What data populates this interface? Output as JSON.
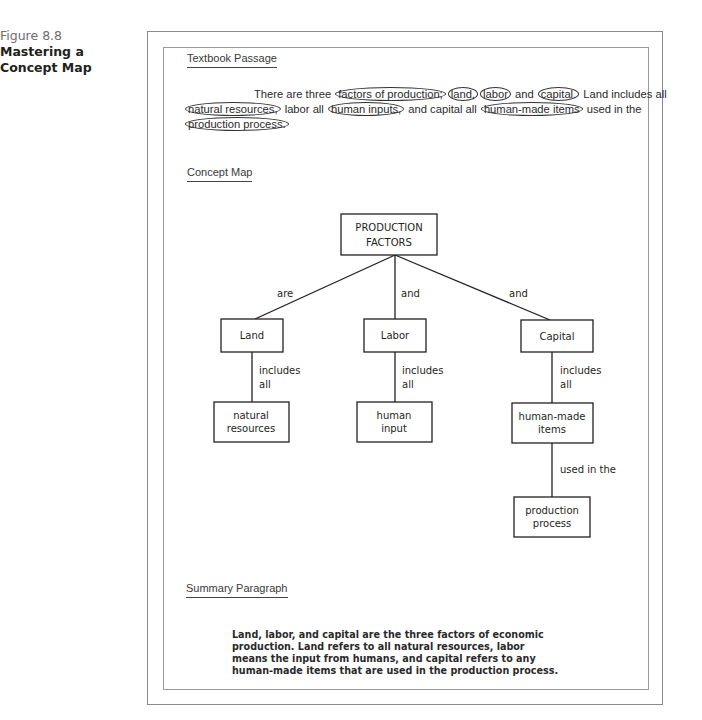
{
  "figure": {
    "number": "Figure 8.8",
    "title": "Mastering a Concept Map"
  },
  "textbook_passage": {
    "heading": "Textbook Passage",
    "lines": [
      [
        {
          "text": "There are three ",
          "circled": false
        },
        {
          "text": "factors of production;",
          "circled": true
        },
        {
          "text": "land,",
          "circled": true
        },
        {
          "text": "labor",
          "circled": true
        },
        {
          "text": " and ",
          "circled": false
        },
        {
          "text": "capital.",
          "circled": true
        },
        {
          "text": " Land includes all",
          "circled": false
        }
      ],
      [
        {
          "text": "natural resources,",
          "circled": true
        },
        {
          "text": " labor all ",
          "circled": false
        },
        {
          "text": "human inputs,",
          "circled": true
        },
        {
          "text": " and capital all ",
          "circled": false
        },
        {
          "text": "human-made items",
          "circled": true
        },
        {
          "text": " used in the",
          "circled": false
        }
      ],
      [
        {
          "text": "production process.",
          "circled": true
        }
      ]
    ]
  },
  "concept_map": {
    "heading": "Concept Map",
    "root": {
      "line1": "PRODUCTION",
      "line2": "FACTORS"
    },
    "links": {
      "land": "are",
      "labor": "and",
      "capital": "and"
    },
    "nodes": {
      "land": "Land",
      "labor": "Labor",
      "capital": "Capital",
      "natural_resources": {
        "line1": "natural",
        "line2": "resources"
      },
      "human_input": {
        "line1": "human",
        "line2": "input"
      },
      "human_made_items": {
        "line1": "human-made",
        "line2": "items"
      },
      "production_process": {
        "line1": "production",
        "line2": "process"
      }
    },
    "sub_links": {
      "land": {
        "line1": "includes",
        "line2": "all"
      },
      "labor": {
        "line1": "includes",
        "line2": "all"
      },
      "capital": {
        "line1": "includes",
        "line2": "all"
      },
      "items": "used in the"
    }
  },
  "summary": {
    "heading": "Summary Paragraph",
    "lines": [
      "Land, labor, and capital are the three factors of economic",
      "production. Land refers to all natural resources, labor",
      "means the input from humans, and capital refers to any",
      "human-made items that are used in the production process."
    ]
  }
}
